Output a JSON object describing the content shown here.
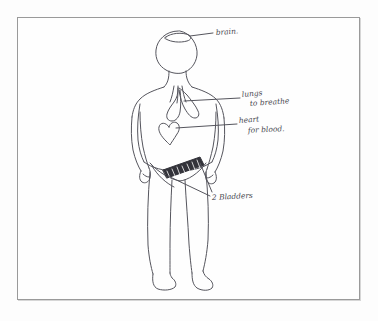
{
  "document": {
    "kind": "pencil-sketch",
    "subject": "human body diagram",
    "paper_color": "#fdfdfd",
    "ink_color": "#55555d",
    "frame_color": "#9a9a9a"
  },
  "figure": {
    "parts": [
      "head",
      "neck",
      "torso",
      "left-arm",
      "right-arm",
      "left-leg",
      "right-leg",
      "left-foot",
      "right-foot"
    ]
  },
  "organs": [
    {
      "id": "brain",
      "name": "brain",
      "label": "brain.",
      "note": "",
      "shape": "oval at top of head"
    },
    {
      "id": "lungs",
      "name": "lungs",
      "label": "lungs",
      "note": "to breathe",
      "shape": "inverted Y with two lobes"
    },
    {
      "id": "heart",
      "name": "heart",
      "label": "heart",
      "note": "for blood.",
      "shape": "heart outline"
    },
    {
      "id": "bladders",
      "name": "bladders",
      "label": "2 Bladders",
      "note": "",
      "shape": "hatched diagonal band across pelvis"
    }
  ],
  "annotations": {
    "brain_label": "brain.",
    "lungs_label": "lungs",
    "lungs_note": "to breathe",
    "heart_label": "heart",
    "heart_note": "for blood.",
    "bladders_label": "2 Bladders"
  }
}
